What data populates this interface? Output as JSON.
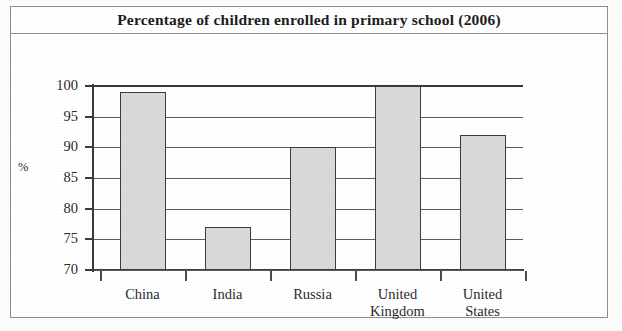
{
  "figure": {
    "title": "Percentage of children enrolled in primary school (2006)",
    "background_color": "#ffffff",
    "frame_color": "#8e8e8e"
  },
  "chart_data": {
    "type": "bar",
    "title": "Percentage of children enrolled in primary school (2006)",
    "categories": [
      "China",
      "India",
      "Russia",
      "United Kingdom",
      "United States"
    ],
    "category_lines": [
      [
        "China"
      ],
      [
        "India"
      ],
      [
        "Russia"
      ],
      [
        "United",
        "Kingdom"
      ],
      [
        "United",
        "States"
      ]
    ],
    "values": [
      99,
      77,
      90,
      100,
      92
    ],
    "xlabel": "",
    "ylabel": "%",
    "ylim": [
      70,
      100
    ],
    "yticks": [
      70,
      75,
      80,
      85,
      90,
      95,
      100
    ],
    "ytick_labels": [
      "70",
      "75",
      "80",
      "85",
      "90",
      "95",
      "100"
    ],
    "grid": true,
    "legend": null,
    "bar_fill_color": "#d9d9d9",
    "bar_edge_color": "#3c3c3c",
    "axis_color": "#3a3a3a"
  }
}
